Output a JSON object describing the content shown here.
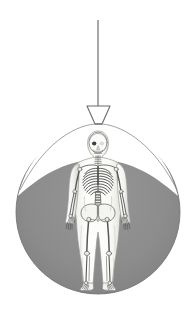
{
  "illustration": {
    "title": "Hanging lamp illuminating anatomical skeleton figure",
    "canvas": {
      "width": 195,
      "height": 315,
      "background": "#ffffff"
    },
    "colors": {
      "background": "#ffffff",
      "pool_fill": "#8c8c8c",
      "pool_edge": "#6f6f6f",
      "cord": "#6e6e6e",
      "shade_fill": "#ffffff",
      "shade_stroke": "#6b6b6b",
      "body_fill": "#f4f4f2",
      "body_stroke": "#9a9a96",
      "bone_fill": "#fbfbf9",
      "bone_stroke": "#5a5a58",
      "bone_shadow": "#3f3f3e"
    },
    "lamp": {
      "label": "Hanging pendant lamp",
      "cord": {
        "x": 98,
        "y_top": 20,
        "y_bottom": 106,
        "width": 1.2
      },
      "shade": {
        "label": "Lamp shade",
        "top_left_x": 87,
        "top_right_x": 110,
        "top_y": 106,
        "bottom_left_x": 95,
        "bottom_right_x": 102,
        "bottom_y": 124
      }
    },
    "light_pool": {
      "label": "Circular pool of light",
      "center_x": 98,
      "center_y": 212,
      "radius": 82,
      "top_cut_y": 131,
      "fill": "#8c8c8c"
    },
    "figure": {
      "label": "Anatomical human figure, anterior view",
      "view": "anterior",
      "center_x": 98,
      "head_top_y": 132,
      "feet_y": 290,
      "height_px": 158,
      "parts": [
        {
          "name": "skull",
          "label": "Skull"
        },
        {
          "name": "cervical-spine",
          "label": "Cervical spine"
        },
        {
          "name": "clavicle",
          "label": "Clavicles"
        },
        {
          "name": "scapula",
          "label": "Scapulae"
        },
        {
          "name": "ribcage",
          "label": "Rib cage",
          "rib_pairs": 10
        },
        {
          "name": "sternum",
          "label": "Sternum"
        },
        {
          "name": "thoracic-spine",
          "label": "Thoracic spine"
        },
        {
          "name": "lumbar-spine",
          "label": "Lumbar spine"
        },
        {
          "name": "pelvis",
          "label": "Pelvis"
        },
        {
          "name": "humerus",
          "label": "Humerus, left and right"
        },
        {
          "name": "radius-ulna",
          "label": "Radius and ulna, left and right"
        },
        {
          "name": "hand-bones",
          "label": "Carpals, metacarpals and phalanges"
        },
        {
          "name": "femur",
          "label": "Femur, left and right"
        },
        {
          "name": "patella",
          "label": "Patella, left and right"
        },
        {
          "name": "tibia-fibula",
          "label": "Tibia and fibula, left and right"
        },
        {
          "name": "foot-bones",
          "label": "Tarsals and metatarsals"
        }
      ]
    }
  }
}
